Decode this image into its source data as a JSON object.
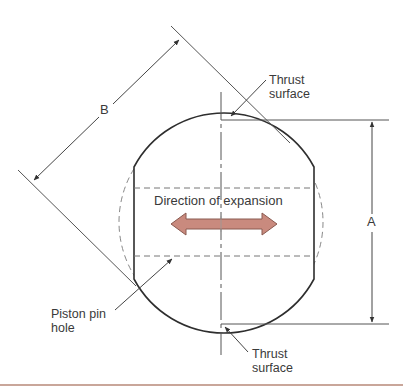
{
  "figure": {
    "labels": {
      "thrust_surface_top": [
        "Thrust",
        "surface"
      ],
      "thrust_surface_bottom": [
        "Thrust",
        "surface"
      ],
      "direction": "Direction of expansion",
      "piston_pin_hole": [
        "Piston pin",
        "hole"
      ],
      "dim_a": "A",
      "dim_b": "B"
    },
    "colors": {
      "line": "#3a3a3a",
      "thin_line": "#555555",
      "dashed": "#777777",
      "arrow_fill": "#c98a7e",
      "arrow_stroke": "#8a5a50",
      "rule": "#c9a69a"
    }
  }
}
